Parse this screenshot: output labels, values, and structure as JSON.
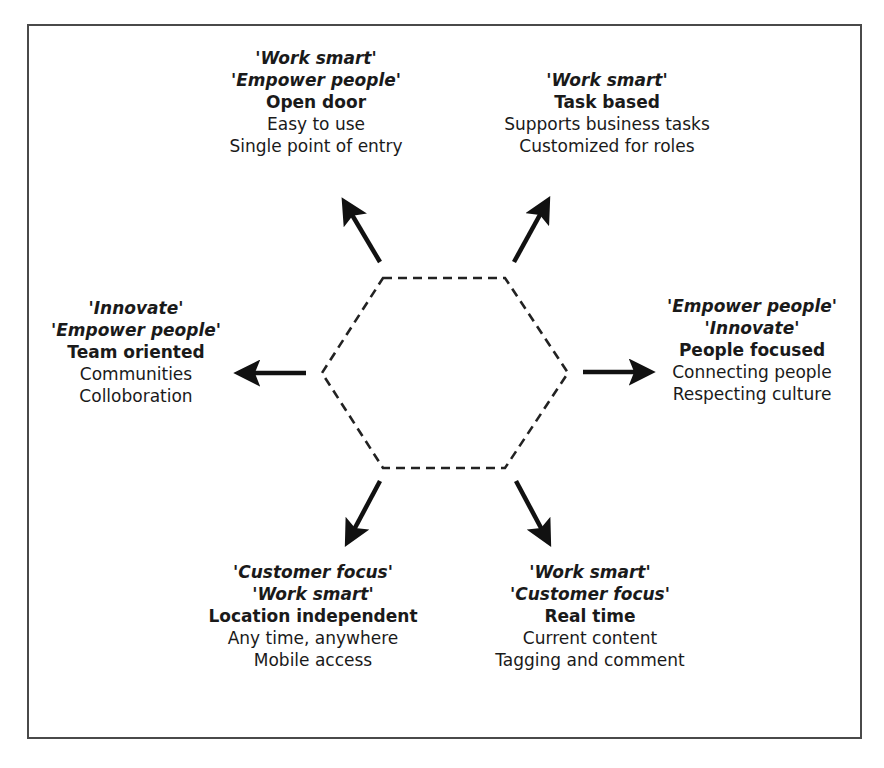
{
  "diagram": {
    "type": "hub-and-spoke",
    "center_shape": "dashed-hexagon",
    "nodes": [
      {
        "position": "top-left",
        "values": [
          "'Work smart'",
          "'Empower people'"
        ],
        "title": "Open door",
        "descriptions": [
          "Easy to use",
          "Single point of entry"
        ]
      },
      {
        "position": "top-right",
        "values": [
          "'Work smart'"
        ],
        "title": "Task based",
        "descriptions": [
          "Supports business tasks",
          "Customized for roles"
        ]
      },
      {
        "position": "left",
        "values": [
          "'Innovate'",
          "'Empower people'"
        ],
        "title": "Team oriented",
        "descriptions": [
          "Communities",
          "Colloboration"
        ]
      },
      {
        "position": "right",
        "values": [
          "'Empower people'",
          "'Innovate'"
        ],
        "title": "People focused",
        "descriptions": [
          "Connecting people",
          "Respecting culture"
        ]
      },
      {
        "position": "bottom-left",
        "values": [
          "'Customer focus'",
          "'Work smart'"
        ],
        "title": "Location independent",
        "descriptions": [
          "Any time, anywhere",
          "Mobile access"
        ]
      },
      {
        "position": "bottom-right",
        "values": [
          "'Work smart'",
          "'Customer focus'"
        ],
        "title": "Real time",
        "descriptions": [
          "Current content",
          "Tagging and comment"
        ]
      }
    ],
    "colors": {
      "text": "#1a1a1a",
      "frame": "#4a4a4a",
      "arrows": "#111111",
      "hexagon": "#222222"
    }
  }
}
